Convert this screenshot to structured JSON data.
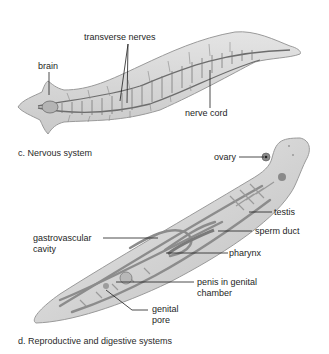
{
  "nervous_system": {
    "caption": "c. Nervous system",
    "labels": {
      "brain": "brain",
      "transverse_nerves": "transverse nerves",
      "nerve_cord": "nerve cord"
    }
  },
  "reproductive_digestive": {
    "caption": "d. Reproductive and digestive systems",
    "labels": {
      "ovary": "ovary",
      "testis": "testis",
      "sperm_duct": "sperm duct",
      "gastrovascular_line1": "gastrovascular",
      "gastrovascular_line2": "cavity",
      "pharynx": "pharynx",
      "penis_line1": "penis in genital",
      "penis_line2": "chamber",
      "genital_line1": "genital",
      "genital_line2": "pore"
    }
  },
  "colors": {
    "body_fill": "#d6d6d6",
    "body_edge": "#9a9a9a",
    "nerve": "#6c6c6c",
    "leader": "#1e1e1e"
  }
}
